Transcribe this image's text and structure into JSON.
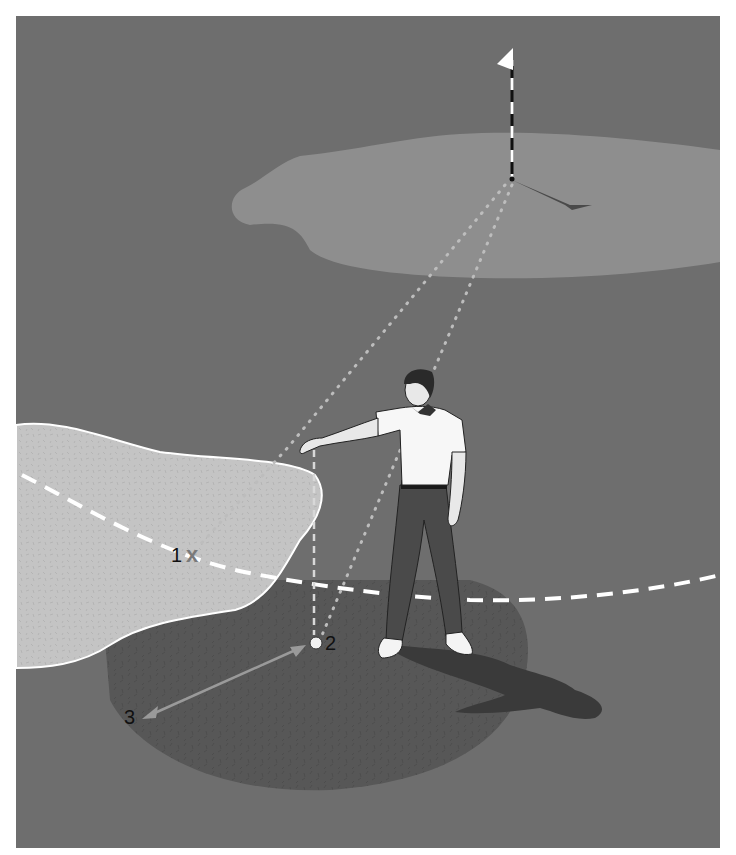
{
  "diagram": {
    "labels": {
      "point_1": "1",
      "point_1_marker": "x",
      "point_2": "2",
      "point_3": "3"
    },
    "elements": [
      {
        "id": "flagstick",
        "description": "flag on pin in putting green"
      },
      {
        "id": "green",
        "description": "putting green"
      },
      {
        "id": "bunker",
        "description": "sand bunker on left"
      },
      {
        "id": "golfer",
        "description": "man dropping ball at arm's length"
      },
      {
        "id": "ball",
        "description": "ball at point 2"
      },
      {
        "id": "drop-zone",
        "description": "dark shaded semicircle area around ball"
      },
      {
        "id": "boundary-line",
        "description": "white dashed curved line"
      },
      {
        "id": "sight-lines",
        "description": "dotted lines from flag to ball and point 1"
      },
      {
        "id": "distance-arrow",
        "description": "double-headed arrow from 2 to 3"
      }
    ]
  },
  "colors": {
    "fairway": "#6e6e6e",
    "green": "#8e8e8e",
    "bunker": "#c4c4c4",
    "drop_zone": "#575757",
    "shadow": "#3a3a3a",
    "white": "#ffffff",
    "arrow": "#9a9a9a",
    "marker_x": "#7a7a7a"
  }
}
